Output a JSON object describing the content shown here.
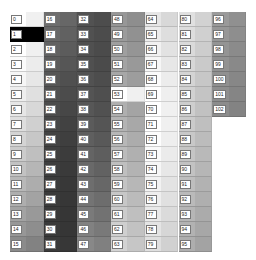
{
  "grid": {
    "columns": [
      {
        "cells": [
          {
            "label": "0",
            "color": "#ffffff"
          },
          {
            "label": "1",
            "color": "#000000"
          },
          {
            "label": "2",
            "color": "#ffffff"
          },
          {
            "label": "3",
            "color": "#fbfbfb"
          },
          {
            "label": "4",
            "color": "#f6f6f6"
          },
          {
            "label": "5",
            "color": "#eeeeee"
          },
          {
            "label": "6",
            "color": "#e6e6e6"
          },
          {
            "label": "7",
            "color": "#dedede"
          },
          {
            "label": "8",
            "color": "#d4d4d4"
          },
          {
            "label": "9",
            "color": "#cbcbcb"
          },
          {
            "label": "10",
            "color": "#c2c2c2"
          },
          {
            "label": "11",
            "color": "#b8b8b8"
          },
          {
            "label": "12",
            "color": "#aeaeae"
          },
          {
            "label": "13",
            "color": "#a3a3a3"
          },
          {
            "label": "14",
            "color": "#979797"
          },
          {
            "label": "15",
            "color": "#8b8b8b"
          }
        ]
      },
      {
        "cells": [
          {
            "label": "16",
            "color": "#6e6e6e"
          },
          {
            "label": "17",
            "color": "#686868"
          },
          {
            "label": "18",
            "color": "#626262"
          },
          {
            "label": "19",
            "color": "#5c5c5c"
          },
          {
            "label": "20",
            "color": "#565656"
          },
          {
            "label": "21",
            "color": "#515151"
          },
          {
            "label": "22",
            "color": "#4c4c4c"
          },
          {
            "label": "23",
            "color": "#474747"
          },
          {
            "label": "24",
            "color": "#434343"
          },
          {
            "label": "25",
            "color": "#404040"
          },
          {
            "label": "26",
            "color": "#3e3e3e"
          },
          {
            "label": "27",
            "color": "#3c3c3c"
          },
          {
            "label": "28",
            "color": "#3b3b3b"
          },
          {
            "label": "29",
            "color": "#3a3a3a"
          },
          {
            "label": "30",
            "color": "#3a3a3a"
          },
          {
            "label": "31",
            "color": "#3b3b3b"
          }
        ]
      },
      {
        "cells": [
          {
            "label": "32",
            "color": "#525252"
          },
          {
            "label": "33",
            "color": "#515151"
          },
          {
            "label": "34",
            "color": "#505050"
          },
          {
            "label": "35",
            "color": "#505050"
          },
          {
            "label": "36",
            "color": "#525252"
          },
          {
            "label": "37",
            "color": "#545454"
          },
          {
            "label": "38",
            "color": "#575757"
          },
          {
            "label": "39",
            "color": "#5b5b5b"
          },
          {
            "label": "40",
            "color": "#5f5f5f"
          },
          {
            "label": "41",
            "color": "#646464"
          },
          {
            "label": "42",
            "color": "#696969"
          },
          {
            "label": "43",
            "color": "#6e6e6e"
          },
          {
            "label": "44",
            "color": "#747474"
          },
          {
            "label": "45",
            "color": "#7a7a7a"
          },
          {
            "label": "46",
            "color": "#818181"
          },
          {
            "label": "47",
            "color": "#888888"
          }
        ]
      },
      {
        "cells": [
          {
            "label": "48",
            "color": "#979797"
          },
          {
            "label": "49",
            "color": "#9b9b9b"
          },
          {
            "label": "50",
            "color": "#9f9f9f"
          },
          {
            "label": "51",
            "color": "#a3a3a3"
          },
          {
            "label": "52",
            "color": "#a7a7a7"
          },
          {
            "label": "53",
            "color": "#abababa"
          },
          {
            "label": "54",
            "color": "#afafaf"
          },
          {
            "label": "55",
            "color": "#b3b3b3"
          },
          {
            "label": "56",
            "color": "#b7b7b7"
          },
          {
            "label": "57",
            "color": "#bbbbbb"
          },
          {
            "label": "58",
            "color": "#bfbfbf"
          },
          {
            "label": "59",
            "color": "#c3c3c3"
          },
          {
            "label": "60",
            "color": "#c7c7c7"
          },
          {
            "label": "61",
            "color": "#cbcbcb"
          },
          {
            "label": "62",
            "color": "#cfcfcf"
          },
          {
            "label": "63",
            "color": "#d3d3d3"
          }
        ]
      },
      {
        "cells": [
          {
            "label": "64",
            "color": "#e6e6e6"
          },
          {
            "label": "65",
            "color": "#ececec"
          },
          {
            "label": "66",
            "color": "#f1f1f1"
          },
          {
            "label": "67",
            "color": "#f6f6f6"
          },
          {
            "label": "68",
            "color": "#fbfbfb"
          },
          {
            "label": "69",
            "color": "#fefefe"
          },
          {
            "label": "70",
            "color": "#ffffff"
          },
          {
            "label": "71",
            "color": "#ffffff"
          },
          {
            "label": "72",
            "color": "#fdfdfd"
          },
          {
            "label": "73",
            "color": "#fafafa"
          },
          {
            "label": "74",
            "color": "#f6f6f6"
          },
          {
            "label": "75",
            "color": "#f2f2f2"
          },
          {
            "label": "76",
            "color": "#eeeeee"
          },
          {
            "label": "77",
            "color": "#e9e9e9"
          },
          {
            "label": "78",
            "color": "#e4e4e4"
          },
          {
            "label": "79",
            "color": "#dfdfdf"
          }
        ]
      },
      {
        "cells": [
          {
            "label": "80",
            "color": "#e0e0e0"
          },
          {
            "label": "81",
            "color": "#dddddd"
          },
          {
            "label": "82",
            "color": "#dadada"
          },
          {
            "label": "83",
            "color": "#d7d7d7"
          },
          {
            "label": "84",
            "color": "#d4d4d4"
          },
          {
            "label": "85",
            "color": "#d1d1d1"
          },
          {
            "label": "86",
            "color": "#cecece"
          },
          {
            "label": "87",
            "color": "#cbcbcb"
          },
          {
            "label": "88",
            "color": "#c8c8c8"
          },
          {
            "label": "89",
            "color": "#c5c5c5"
          },
          {
            "label": "90",
            "color": "#c2c2c2"
          },
          {
            "label": "91",
            "color": "#bebebe"
          },
          {
            "label": "92",
            "color": "#bababa"
          },
          {
            "label": "93",
            "color": "#b6b6b6"
          },
          {
            "label": "94",
            "color": "#b2b2b2"
          },
          {
            "label": "95",
            "color": "#aeaeae"
          }
        ]
      },
      {
        "cells": [
          {
            "label": "96",
            "color": "#9a9a9a"
          },
          {
            "label": "97",
            "color": "#979797"
          },
          {
            "label": "98",
            "color": "#949494"
          },
          {
            "label": "99",
            "color": "#929292"
          },
          {
            "label": "100",
            "color": "#909090"
          },
          {
            "label": "101",
            "color": "#8e8e8e"
          },
          {
            "label": "102",
            "color": "#8c8c8c"
          }
        ]
      }
    ]
  }
}
